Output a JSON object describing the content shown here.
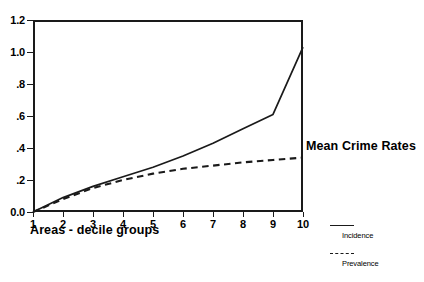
{
  "chart_data": {
    "type": "line",
    "title": "",
    "side_title": "Mean Crime Rates",
    "xlabel": "Areas - decile groups",
    "ylabel": "",
    "x": [
      1,
      2,
      3,
      4,
      5,
      6,
      7,
      8,
      9,
      10
    ],
    "xtick_labels": [
      "1",
      "2",
      "3",
      "4",
      "5",
      "6",
      "7",
      "8",
      "9",
      "10"
    ],
    "ytick_labels": [
      "0.0",
      ".2",
      ".4",
      ".6",
      ".8",
      "1.0",
      "1.2"
    ],
    "ytick_values": [
      0.0,
      0.2,
      0.4,
      0.6,
      0.8,
      1.0,
      1.2
    ],
    "xlim": [
      1,
      10
    ],
    "ylim": [
      0.0,
      1.2
    ],
    "grid": false,
    "legend_position": "right-bottom",
    "series": [
      {
        "name": "Incidence",
        "style": "solid",
        "color": "#1a1a1a",
        "values": [
          0.0,
          0.09,
          0.16,
          0.22,
          0.28,
          0.35,
          0.43,
          0.52,
          0.61,
          1.03
        ]
      },
      {
        "name": "Prevalence",
        "style": "dashed",
        "color": "#1a1a1a",
        "values": [
          0.0,
          0.08,
          0.15,
          0.2,
          0.24,
          0.27,
          0.29,
          0.31,
          0.325,
          0.34
        ]
      }
    ]
  },
  "legend": {
    "items": [
      {
        "label": "Incidence",
        "style": "solid"
      },
      {
        "label": "Prevalence",
        "style": "dashed"
      }
    ]
  }
}
